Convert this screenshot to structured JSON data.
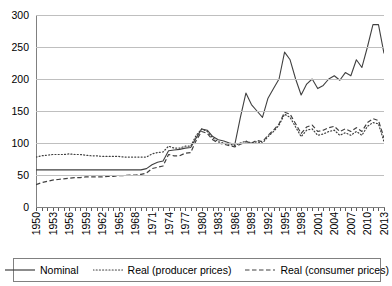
{
  "chart_data": {
    "type": "line",
    "title": "",
    "xlabel": "",
    "ylabel": "",
    "ylim": [
      0,
      300
    ],
    "xlim": [
      1950,
      2013
    ],
    "grid": true,
    "legend_position": "bottom",
    "yticks": [
      0,
      50,
      100,
      150,
      200,
      250,
      300
    ],
    "xticks": [
      1950,
      1953,
      1956,
      1959,
      1962,
      1965,
      1968,
      1971,
      1974,
      1977,
      1980,
      1983,
      1986,
      1989,
      1992,
      1995,
      1998,
      2001,
      2004,
      2007,
      2010,
      2013
    ],
    "x": [
      1950,
      1951,
      1952,
      1953,
      1954,
      1955,
      1956,
      1957,
      1958,
      1959,
      1960,
      1961,
      1962,
      1963,
      1964,
      1965,
      1966,
      1967,
      1968,
      1969,
      1970,
      1971,
      1972,
      1973,
      1974,
      1975,
      1976,
      1977,
      1978,
      1979,
      1980,
      1981,
      1982,
      1983,
      1984,
      1985,
      1986,
      1987,
      1988,
      1989,
      1990,
      1991,
      1992,
      1993,
      1994,
      1995,
      1996,
      1997,
      1998,
      1999,
      2000,
      2001,
      2002,
      2003,
      2004,
      2005,
      2006,
      2007,
      2008,
      2009,
      2010,
      2011,
      2012,
      2013
    ],
    "series": [
      {
        "name": "Nominal",
        "style": "solid",
        "color": "#404040",
        "values": [
          58,
          58,
          58,
          58,
          58,
          58,
          58,
          58,
          58,
          58,
          58,
          58,
          58,
          58,
          58,
          58,
          58,
          58,
          58,
          58,
          60,
          66,
          70,
          72,
          88,
          89,
          90,
          92,
          93,
          108,
          122,
          120,
          110,
          105,
          103,
          100,
          98,
          140,
          178,
          160,
          150,
          140,
          170,
          185,
          200,
          242,
          230,
          200,
          175,
          192,
          200,
          185,
          190,
          200,
          205,
          198,
          210,
          205,
          230,
          218,
          250,
          285,
          285,
          240
        ]
      },
      {
        "name": "Real (producer prices)",
        "style": "dotted",
        "color": "#404040",
        "values": [
          78,
          80,
          81,
          82,
          82,
          82,
          83,
          82,
          82,
          81,
          80,
          80,
          79,
          79,
          79,
          79,
          78,
          78,
          78,
          78,
          78,
          83,
          85,
          86,
          95,
          92,
          92,
          95,
          95,
          112,
          122,
          118,
          108,
          102,
          100,
          98,
          96,
          100,
          103,
          100,
          102,
          100,
          110,
          118,
          128,
          145,
          140,
          125,
          110,
          120,
          122,
          112,
          114,
          118,
          120,
          112,
          116,
          112,
          118,
          112,
          126,
          132,
          130,
          102
        ]
      },
      {
        "name": "Real (consumer prices)",
        "style": "dashed",
        "color": "#404040",
        "values": [
          35,
          38,
          40,
          42,
          43,
          44,
          45,
          46,
          46,
          47,
          47,
          47,
          47,
          48,
          48,
          49,
          49,
          50,
          50,
          51,
          53,
          60,
          62,
          64,
          82,
          80,
          80,
          84,
          85,
          104,
          118,
          115,
          105,
          100,
          98,
          96,
          94,
          98,
          102,
          100,
          104,
          102,
          112,
          120,
          130,
          148,
          145,
          130,
          115,
          125,
          128,
          118,
          120,
          124,
          126,
          118,
          122,
          118,
          124,
          118,
          132,
          138,
          135,
          108
        ]
      }
    ]
  },
  "legend": {
    "items": [
      {
        "label": "Nominal",
        "style": "solid"
      },
      {
        "label": "Real (producer prices)",
        "style": "dotted"
      },
      {
        "label": "Real (consumer prices)",
        "style": "dashed"
      }
    ]
  },
  "colors": {
    "line": "#404040",
    "grid": "#bfbfbf",
    "axis": "#808080",
    "text": "#000000"
  }
}
